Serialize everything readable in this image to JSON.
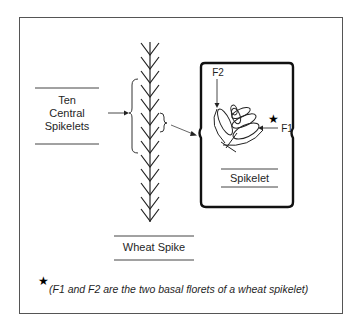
{
  "figure": {
    "left_label": {
      "line1": "Ten",
      "line2": "Central",
      "line3": "Spikelets"
    },
    "spike_label": "Wheat Spike",
    "spikelet_label": "Spikelet",
    "floret_labels": {
      "f1": "F1",
      "f2": "F2"
    },
    "star_icon": "★",
    "footnote": "(F1 and F2 are the two basal florets of a wheat spikelet)"
  }
}
